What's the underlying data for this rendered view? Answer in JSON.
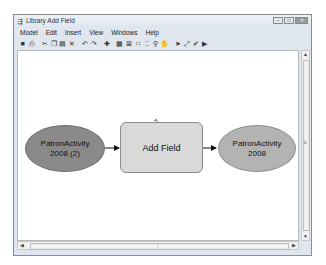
{
  "window": {
    "title": "Library Add Field",
    "title_icon": "model-builder-icon",
    "controls": {
      "minimize": "–",
      "maximize": "□",
      "close": "✕"
    }
  },
  "menubar": {
    "items": [
      "Model",
      "Edit",
      "Insert",
      "View",
      "Windows",
      "Help"
    ]
  },
  "toolbar": {
    "tools": [
      {
        "name": "save-icon",
        "glyph": "■"
      },
      {
        "name": "print-icon",
        "glyph": "⎙"
      },
      {
        "name": "sep"
      },
      {
        "name": "cut-icon",
        "glyph": "✂"
      },
      {
        "name": "copy-icon",
        "glyph": "❐"
      },
      {
        "name": "paste-icon",
        "glyph": "▤"
      },
      {
        "name": "delete-icon",
        "glyph": "✕"
      },
      {
        "name": "sep"
      },
      {
        "name": "undo-icon",
        "glyph": "↶"
      },
      {
        "name": "redo-icon",
        "glyph": "↷"
      },
      {
        "name": "sep"
      },
      {
        "name": "add-data-icon",
        "glyph": "✚"
      },
      {
        "name": "sep"
      },
      {
        "name": "auto-layout-icon",
        "glyph": "▦"
      },
      {
        "name": "full-extent-icon",
        "glyph": "⊠"
      },
      {
        "name": "fixed-zoom-in-icon",
        "glyph": "∷"
      },
      {
        "name": "fixed-zoom-out-icon",
        "glyph": "⁚⁚"
      },
      {
        "name": "zoom-icon",
        "glyph": "⚲"
      },
      {
        "name": "pan-icon",
        "glyph": "✋"
      },
      {
        "name": "sep"
      },
      {
        "name": "select-icon",
        "glyph": "➤"
      },
      {
        "name": "connect-icon",
        "glyph": "⤢"
      },
      {
        "name": "validate-icon",
        "glyph": "✔"
      },
      {
        "name": "run-icon",
        "glyph": "▶"
      }
    ]
  },
  "model": {
    "nodes": [
      {
        "id": "input",
        "type": "input-data",
        "label_line1": "PatronActivity",
        "label_line2": "2008 (2)",
        "color": "#8a8a8a"
      },
      {
        "id": "tool",
        "type": "tool",
        "label": "Add Field",
        "color": "#d9d9d9"
      },
      {
        "id": "output",
        "type": "derived-data",
        "label_line1": "PatronActivity",
        "label_line2": "2008",
        "color": "#b3b3b3"
      }
    ],
    "connections": [
      [
        "input",
        "tool"
      ],
      [
        "tool",
        "output"
      ]
    ]
  },
  "scrollbars": {
    "vertical": {
      "up": "▲",
      "down": "▼",
      "grip": "≡"
    },
    "horizontal": {
      "left": "◀",
      "right": "▶",
      "grip": "⦙"
    }
  }
}
